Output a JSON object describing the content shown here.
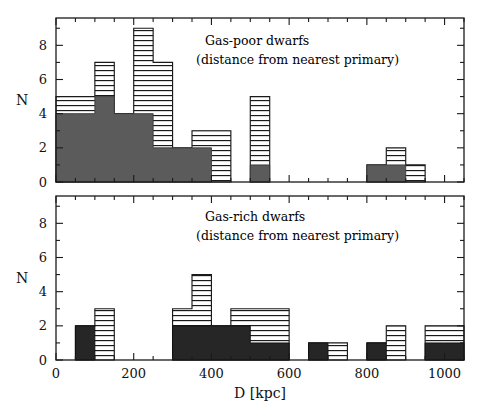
{
  "figure": {
    "xlabel": "D [kpc]",
    "ylabel_top": "N",
    "ylabel_bottom": "N"
  },
  "panels": {
    "top": {
      "annotation_line1": "Gas-poor dwarfs",
      "annotation_line2": "(distance from nearest primary)",
      "ylabel": "N"
    },
    "bottom": {
      "annotation_line1": "Gas-rich dwarfs",
      "annotation_line2": "(distance from nearest primary)",
      "ylabel": "N"
    }
  },
  "axis": {
    "x_ticks": [
      0,
      200,
      400,
      600,
      800,
      1000
    ],
    "x_tick_labels": [
      "0",
      "200",
      "400",
      "600",
      "800",
      "1000"
    ],
    "x_minor_step": 50,
    "x_range": [
      0,
      1050
    ],
    "y_ticks": [
      0,
      2,
      4,
      6,
      8
    ],
    "y_tick_labels": [
      "0",
      "2",
      "4",
      "6",
      "8"
    ],
    "y_minor_step": 1,
    "y_range": [
      0,
      9.6
    ]
  },
  "colors": {
    "solid_fill": "#5b5b5b",
    "dark_fill": "#262626",
    "hatch_stroke": "#1a1a1a",
    "axis": "#1a1a1a",
    "background": "#ffffff"
  },
  "chart_data": [
    {
      "type": "bar",
      "title": "Gas-poor dwarfs",
      "subtitle": "(distance from nearest primary)",
      "xlabel": "D [kpc]",
      "ylabel": "N",
      "xlim": [
        0,
        1050
      ],
      "ylim": [
        0,
        9.6
      ],
      "grid": false,
      "legend": "none",
      "bin_width": 50,
      "bin_starts": [
        0,
        50,
        100,
        150,
        200,
        250,
        300,
        350,
        400,
        450,
        500,
        550,
        600,
        650,
        700,
        750,
        800,
        850,
        900,
        950,
        1000
      ],
      "series": [
        {
          "name": "total (hatched)",
          "style": "horizontal-hatch",
          "values": [
            5,
            5,
            7,
            4,
            9,
            7,
            2,
            3,
            3,
            0,
            5,
            0,
            0,
            0,
            0,
            0,
            1,
            2,
            1,
            0,
            0
          ]
        },
        {
          "name": "subset (solid gray)",
          "style": "solid-gray",
          "values": [
            4,
            4,
            5,
            4,
            4,
            2,
            2,
            2,
            0,
            0,
            1,
            0,
            0,
            0,
            0,
            0,
            1,
            1,
            0,
            0,
            0
          ]
        }
      ]
    },
    {
      "type": "bar",
      "title": "Gas-rich dwarfs",
      "subtitle": "(distance from nearest primary)",
      "xlabel": "D [kpc]",
      "ylabel": "N",
      "xlim": [
        0,
        1050
      ],
      "ylim": [
        0,
        9.6
      ],
      "grid": false,
      "legend": "none",
      "bin_width": 50,
      "bin_starts": [
        0,
        50,
        100,
        150,
        200,
        250,
        300,
        350,
        400,
        450,
        500,
        550,
        600,
        650,
        700,
        750,
        800,
        850,
        900,
        950,
        1000
      ],
      "series": [
        {
          "name": "total (hatched)",
          "style": "horizontal-hatch",
          "values": [
            0,
            2,
            3,
            0,
            0,
            0,
            3,
            5,
            2,
            3,
            3,
            3,
            0,
            1,
            1,
            0,
            1,
            2,
            0,
            2,
            2
          ]
        },
        {
          "name": "subset (solid dark)",
          "style": "solid-dark",
          "values": [
            0,
            2,
            0,
            0,
            0,
            0,
            2,
            2,
            2,
            2,
            1,
            1,
            0,
            1,
            0,
            0,
            1,
            0,
            0,
            1,
            1
          ]
        }
      ]
    }
  ]
}
